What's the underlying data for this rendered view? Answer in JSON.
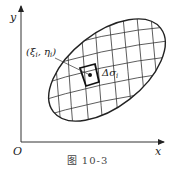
{
  "figure": {
    "axes": {
      "x_label": "x",
      "y_label": "y",
      "origin_label": "O"
    },
    "region": {
      "shape": "ellipse",
      "center": [
        107,
        70
      ],
      "rx": 68,
      "ry": 37,
      "rotation_deg": -38
    },
    "point_label": "(ξi, ηi)",
    "point_label_parts": {
      "xi": "ξ",
      "xi_sub": "i",
      "eta": "η",
      "eta_sub": "i"
    },
    "cell_label": "Δσi",
    "cell_label_parts": {
      "main": "Δσ",
      "sub": "i"
    },
    "caption": "图   10-3",
    "colors": {
      "stroke": "#222222",
      "background": "#ffffff",
      "text": "#222222"
    }
  }
}
